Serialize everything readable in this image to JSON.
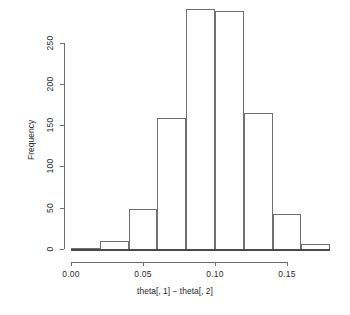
{
  "chart_data": {
    "type": "bar",
    "subtype": "histogram",
    "title": "",
    "xlabel": "theta[, 1] − theta[, 2]",
    "ylabel": "Frequency",
    "bin_width": 0.02,
    "bin_edges": [
      0.0,
      0.02,
      0.04,
      0.06,
      0.08,
      0.1,
      0.12,
      0.14,
      0.16,
      0.18
    ],
    "categories": [
      "0.00-0.02",
      "0.02-0.04",
      "0.04-0.06",
      "0.06-0.08",
      "0.08-0.10",
      "0.10-0.12",
      "0.12-0.14",
      "0.14-0.16",
      "0.16-0.18"
    ],
    "values": [
      1,
      10,
      48,
      158,
      290,
      288,
      165,
      42,
      6
    ],
    "xlim": [
      0.0,
      0.18
    ],
    "ylim": [
      0,
      295
    ],
    "xticks": [
      0.0,
      0.05,
      0.1,
      0.15
    ],
    "xtick_labels": [
      "0.00",
      "0.05",
      "0.10",
      "0.15"
    ],
    "yticks": [
      0,
      50,
      100,
      150,
      200,
      250
    ],
    "ytick_labels": [
      "0",
      "50",
      "100",
      "150",
      "200",
      "250"
    ],
    "grid": false,
    "legend": null,
    "bar_fill": "#ffffff",
    "bar_stroke": "#707070",
    "axis_color": "#6e6e6e",
    "background": "#ffffff"
  }
}
